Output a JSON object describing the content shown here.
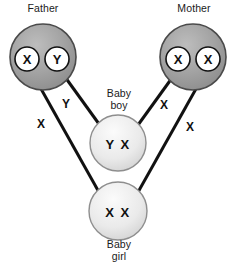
{
  "diagram": {
    "colors": {
      "parent_fill_light": "#b5b5b5",
      "parent_fill_dark": "#8d8d8d",
      "child_fill_light": "#f2f2f2",
      "child_fill_dark": "#c9c9c9",
      "allele_fill": "#ffffff",
      "stroke": "#111111",
      "text": "#1a1a1a",
      "background": "#ffffff"
    },
    "nodes": [
      {
        "id": "father",
        "label": "Father",
        "label_lines": "Father",
        "type": "parent",
        "cx": 43,
        "cy": 57,
        "r": 33,
        "alleles": [
          {
            "symbol": "X",
            "cx": 27,
            "cy": 59,
            "r": 12
          },
          {
            "symbol": "Y",
            "cx": 57,
            "cy": 59,
            "r": 12
          }
        ]
      },
      {
        "id": "mother",
        "label": "Mother",
        "label_lines": "Mother",
        "type": "parent",
        "cx": 193,
        "cy": 57,
        "r": 33,
        "alleles": [
          {
            "symbol": "X",
            "cx": 178,
            "cy": 59,
            "r": 12
          },
          {
            "symbol": "X",
            "cx": 208,
            "cy": 59,
            "r": 12
          }
        ]
      },
      {
        "id": "baby-boy",
        "label": "Baby boy",
        "label_lines": "Baby\nboy",
        "type": "child",
        "cx": 118,
        "cy": 143,
        "r": 28,
        "genotype": "Y X"
      },
      {
        "id": "baby-girl",
        "label": "Baby girl",
        "label_lines": "Baby\ngirl",
        "type": "child",
        "cx": 118,
        "cy": 211,
        "r": 29,
        "genotype": "X X"
      }
    ],
    "edges": [
      {
        "id": "father-y-to-boy",
        "from": "father",
        "to": "baby-boy",
        "allele_label": "Y",
        "x1": 60,
        "y1": 70,
        "x2": 99,
        "y2": 124,
        "label_x": 66,
        "label_y": 104
      },
      {
        "id": "father-x-to-girl",
        "from": "father",
        "to": "baby-girl",
        "allele_label": "X",
        "x1": 31,
        "y1": 71,
        "x2": 100,
        "y2": 194,
        "label_x": 41,
        "label_y": 124
      },
      {
        "id": "mother-x-to-boy",
        "from": "mother",
        "to": "baby-boy",
        "allele_label": "X",
        "x1": 177,
        "y1": 71,
        "x2": 138,
        "y2": 125,
        "label_x": 164,
        "label_y": 105
      },
      {
        "id": "mother-x-to-girl",
        "from": "mother",
        "to": "baby-girl",
        "allele_label": "X",
        "x1": 206,
        "y1": 71,
        "x2": 137,
        "y2": 194,
        "label_x": 190,
        "label_y": 127
      }
    ]
  }
}
